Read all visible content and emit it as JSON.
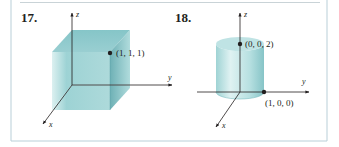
{
  "colors": {
    "frame_border": "#b9cfd8",
    "top_rule": "#c9d3d7",
    "solid_fill": "#8fc9cc",
    "solid_fill_light": "#cfe9ea",
    "solid_fill_dark": "#5fa9ae",
    "axis": "#231f20"
  },
  "panels": [
    {
      "number": "17.",
      "shape": "cube",
      "axes": {
        "x": "x",
        "y": "y",
        "z": "z"
      },
      "points": [
        {
          "label": "(1, 1, 1)",
          "coords": [
            1,
            1,
            1
          ]
        }
      ]
    },
    {
      "number": "18.",
      "shape": "cylinder",
      "axes": {
        "x": "x",
        "y": "y",
        "z": "z"
      },
      "points": [
        {
          "label": "(0, 0, 2)",
          "coords": [
            0,
            0,
            2
          ]
        },
        {
          "label": "(1, 0, 0)",
          "coords": [
            1,
            0,
            0
          ]
        }
      ]
    }
  ]
}
